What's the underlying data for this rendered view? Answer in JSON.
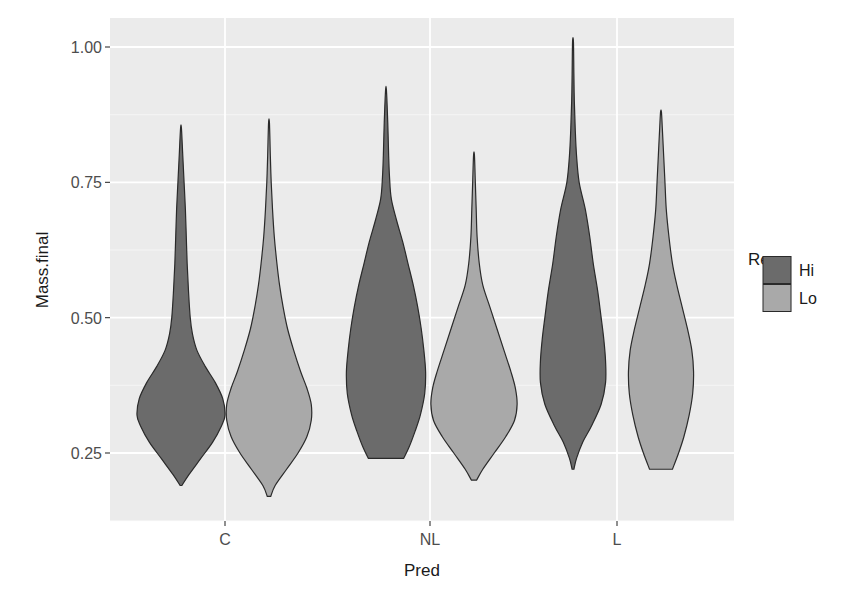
{
  "chart_data": {
    "type": "violin",
    "title": "",
    "xlabel": "Pred",
    "ylabel": "Mass.final",
    "categories": [
      "C",
      "NL",
      "L"
    ],
    "yticks": [
      "0.25",
      "0.50",
      "0.75",
      "1.00"
    ],
    "ytick_values": [
      0.25,
      0.5,
      0.75,
      1.0
    ],
    "ylim": [
      0.14,
      1.03
    ],
    "grid": true,
    "legend": {
      "title": "Res",
      "position": "right",
      "entries": [
        {
          "label": "Hi",
          "color": "#6b6b6b"
        },
        {
          "label": "Lo",
          "color": "#a9a9a9"
        }
      ]
    },
    "series": [
      {
        "name": "Hi",
        "color": "#6b6b6b",
        "violins": [
          {
            "category": "C",
            "min": 0.19,
            "max": 0.85,
            "mode": 0.32,
            "profile": [
              [
                0.19,
                0.02
              ],
              [
                0.21,
                0.18
              ],
              [
                0.24,
                0.45
              ],
              [
                0.27,
                0.72
              ],
              [
                0.3,
                0.92
              ],
              [
                0.32,
                1.0
              ],
              [
                0.35,
                0.95
              ],
              [
                0.38,
                0.78
              ],
              [
                0.41,
                0.55
              ],
              [
                0.44,
                0.36
              ],
              [
                0.47,
                0.26
              ],
              [
                0.5,
                0.21
              ],
              [
                0.55,
                0.17
              ],
              [
                0.6,
                0.14
              ],
              [
                0.65,
                0.12
              ],
              [
                0.7,
                0.1
              ],
              [
                0.75,
                0.07
              ],
              [
                0.8,
                0.04
              ],
              [
                0.85,
                0.01
              ]
            ]
          },
          {
            "category": "NL",
            "min": 0.24,
            "max": 0.92,
            "mode": 0.4,
            "profile": [
              [
                0.24,
                0.4
              ],
              [
                0.26,
                0.52
              ],
              [
                0.29,
                0.66
              ],
              [
                0.32,
                0.78
              ],
              [
                0.36,
                0.88
              ],
              [
                0.4,
                0.9
              ],
              [
                0.44,
                0.86
              ],
              [
                0.48,
                0.8
              ],
              [
                0.52,
                0.72
              ],
              [
                0.56,
                0.62
              ],
              [
                0.6,
                0.5
              ],
              [
                0.64,
                0.38
              ],
              [
                0.68,
                0.24
              ],
              [
                0.72,
                0.12
              ],
              [
                0.76,
                0.08
              ],
              [
                0.8,
                0.06
              ],
              [
                0.86,
                0.04
              ],
              [
                0.92,
                0.01
              ]
            ]
          },
          {
            "category": "L",
            "min": 0.22,
            "max": 1.01,
            "mode": 0.38,
            "profile": [
              [
                0.22,
                0.02
              ],
              [
                0.24,
                0.08
              ],
              [
                0.27,
                0.22
              ],
              [
                0.3,
                0.42
              ],
              [
                0.34,
                0.64
              ],
              [
                0.38,
                0.74
              ],
              [
                0.42,
                0.74
              ],
              [
                0.46,
                0.7
              ],
              [
                0.5,
                0.64
              ],
              [
                0.55,
                0.56
              ],
              [
                0.6,
                0.46
              ],
              [
                0.65,
                0.38
              ],
              [
                0.7,
                0.28
              ],
              [
                0.75,
                0.14
              ],
              [
                0.8,
                0.08
              ],
              [
                0.85,
                0.05
              ],
              [
                0.9,
                0.03
              ],
              [
                0.95,
                0.02
              ],
              [
                1.01,
                0.01
              ]
            ]
          }
        ]
      },
      {
        "name": "Lo",
        "color": "#a9a9a9",
        "violins": [
          {
            "category": "C",
            "min": 0.17,
            "max": 0.86,
            "mode": 0.32,
            "profile": [
              [
                0.17,
                0.04
              ],
              [
                0.19,
                0.14
              ],
              [
                0.22,
                0.4
              ],
              [
                0.25,
                0.66
              ],
              [
                0.28,
                0.86
              ],
              [
                0.31,
                0.96
              ],
              [
                0.34,
                0.96
              ],
              [
                0.37,
                0.86
              ],
              [
                0.4,
                0.72
              ],
              [
                0.44,
                0.56
              ],
              [
                0.48,
                0.42
              ],
              [
                0.52,
                0.32
              ],
              [
                0.56,
                0.24
              ],
              [
                0.6,
                0.18
              ],
              [
                0.65,
                0.12
              ],
              [
                0.7,
                0.08
              ],
              [
                0.75,
                0.05
              ],
              [
                0.8,
                0.03
              ],
              [
                0.86,
                0.01
              ]
            ]
          },
          {
            "category": "NL",
            "min": 0.2,
            "max": 0.8,
            "mode": 0.34,
            "profile": [
              [
                0.2,
                0.06
              ],
              [
                0.22,
                0.2
              ],
              [
                0.25,
                0.46
              ],
              [
                0.28,
                0.72
              ],
              [
                0.31,
                0.92
              ],
              [
                0.34,
                0.98
              ],
              [
                0.37,
                0.94
              ],
              [
                0.4,
                0.84
              ],
              [
                0.44,
                0.68
              ],
              [
                0.48,
                0.52
              ],
              [
                0.52,
                0.36
              ],
              [
                0.56,
                0.2
              ],
              [
                0.6,
                0.12
              ],
              [
                0.65,
                0.07
              ],
              [
                0.7,
                0.05
              ],
              [
                0.75,
                0.03
              ],
              [
                0.8,
                0.01
              ]
            ]
          },
          {
            "category": "L",
            "min": 0.22,
            "max": 0.88,
            "mode": 0.4,
            "profile": [
              [
                0.22,
                0.26
              ],
              [
                0.25,
                0.4
              ],
              [
                0.28,
                0.52
              ],
              [
                0.32,
                0.64
              ],
              [
                0.36,
                0.72
              ],
              [
                0.4,
                0.74
              ],
              [
                0.44,
                0.7
              ],
              [
                0.48,
                0.6
              ],
              [
                0.52,
                0.48
              ],
              [
                0.56,
                0.36
              ],
              [
                0.6,
                0.26
              ],
              [
                0.65,
                0.18
              ],
              [
                0.7,
                0.12
              ],
              [
                0.75,
                0.09
              ],
              [
                0.8,
                0.06
              ],
              [
                0.85,
                0.03
              ],
              [
                0.88,
                0.01
              ]
            ]
          }
        ]
      }
    ]
  },
  "labels": {
    "xlabel": "Pred",
    "ylabel": "Mass.final",
    "legend_title": "Res"
  }
}
